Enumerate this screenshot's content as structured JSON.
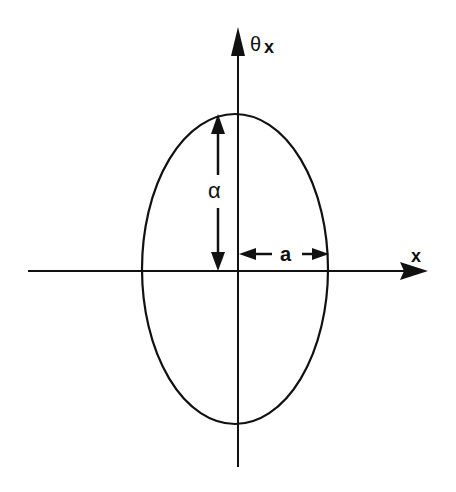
{
  "diagram": {
    "type": "phase-space ellipse",
    "axes": {
      "horizontal": {
        "label": "x",
        "direction": "right"
      },
      "vertical": {
        "label": "θx",
        "label_main": "θ",
        "label_sub": "x",
        "direction": "up"
      }
    },
    "ellipse": {
      "semi_axis_horizontal_label": "a",
      "semi_axis_vertical_label": "α"
    },
    "colors": {
      "stroke": "#111111",
      "background": "#ffffff"
    }
  }
}
